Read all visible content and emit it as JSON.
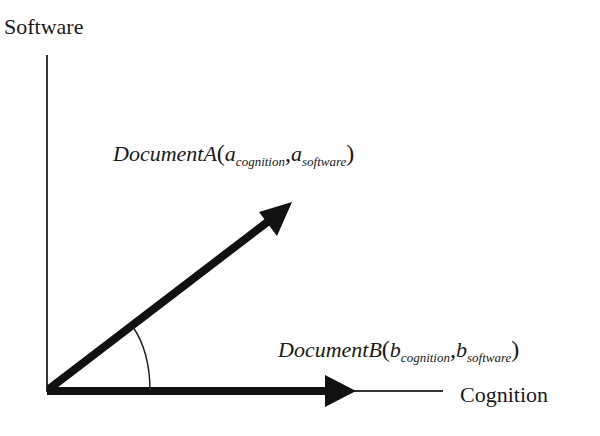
{
  "diagram": {
    "axes": {
      "y_label": "Software",
      "x_label": "Cognition"
    },
    "vectors": [
      {
        "name": "DocumentA",
        "var": "a",
        "sub1": "cognition",
        "sub2": "software",
        "open": "(",
        "comma": ",",
        "close": ")"
      },
      {
        "name": "DocumentB",
        "var": "b",
        "sub1": "cognition",
        "sub2": "software",
        "open": "(",
        "comma": ",",
        "close": ")"
      }
    ],
    "colors": {
      "line": "#111111",
      "text": "#1a1a1a",
      "background": "#ffffff"
    }
  }
}
